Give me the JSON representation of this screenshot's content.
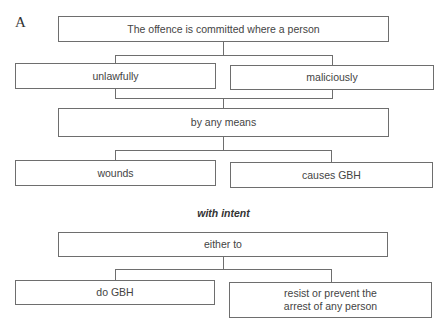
{
  "figure": {
    "label": "A",
    "title": "The offence is committed where a person",
    "level1": {
      "options": [
        "unlawfully",
        "maliciously"
      ]
    },
    "level2": {
      "label": "by any means",
      "options": [
        "wounds",
        "causes GBH"
      ]
    },
    "connector": "with intent",
    "level3": {
      "label": "either to",
      "options": [
        "do GBH",
        "resist or prevent the arrest of any person"
      ]
    }
  },
  "colors": {
    "line": "#6e6e6e",
    "text": "#444444",
    "background": "#ffffff"
  }
}
